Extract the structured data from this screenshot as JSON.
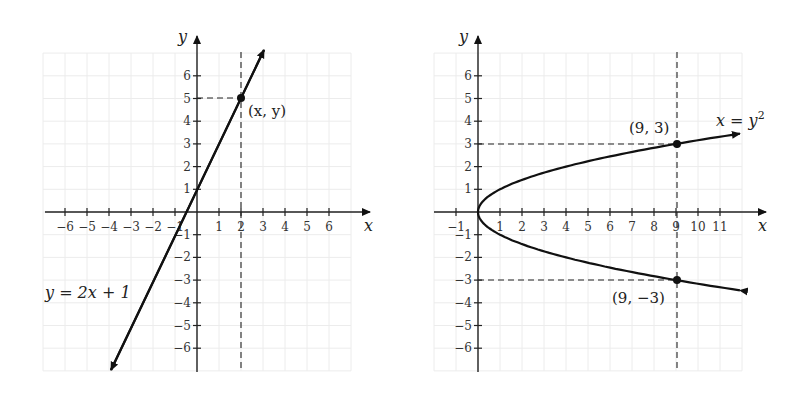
{
  "chart_data": [
    {
      "type": "line",
      "title": "",
      "equation_label": "y = 2x + 1",
      "xlabel": "x",
      "ylabel": "y",
      "xlim": [
        -7,
        7
      ],
      "ylim": [
        -7,
        7
      ],
      "x_ticks": [
        -6,
        -5,
        -4,
        -3,
        -2,
        -1,
        1,
        2,
        3,
        4,
        5,
        6
      ],
      "y_ticks": [
        -6,
        -5,
        -4,
        -3,
        -2,
        -1,
        1,
        2,
        3,
        4,
        5,
        6
      ],
      "grid": true,
      "series": [
        {
          "name": "y = 2x + 1",
          "x": [
            -4,
            3
          ],
          "y": [
            -7,
            7
          ]
        }
      ],
      "points": [
        {
          "x": 2,
          "y": 5,
          "label": "(x, y)"
        }
      ],
      "guides": [
        {
          "type": "vertical-dashed",
          "x": 2
        },
        {
          "type": "horizontal-dashed",
          "y": 5,
          "from_x": 0,
          "to_x": 2
        }
      ]
    },
    {
      "type": "line",
      "title": "",
      "equation_label": "x = y²",
      "xlabel": "x",
      "ylabel": "y",
      "xlim": [
        -1.5,
        13
      ],
      "ylim": [
        -7,
        7
      ],
      "x_ticks": [
        -1,
        1,
        2,
        3,
        4,
        5,
        6,
        7,
        8,
        9,
        10,
        11
      ],
      "y_ticks": [
        -6,
        -5,
        -4,
        -3,
        -2,
        -1,
        1,
        2,
        3,
        4,
        5,
        6
      ],
      "grid": true,
      "series": [
        {
          "name": "x = y²",
          "x": [
            12,
            9,
            4,
            1,
            0,
            1,
            4,
            9,
            12
          ],
          "y": [
            3.46,
            3,
            2,
            1,
            0,
            -1,
            -2,
            -3,
            -3.46
          ]
        }
      ],
      "points": [
        {
          "x": 9,
          "y": 3,
          "label": "(9, 3)"
        },
        {
          "x": 9,
          "y": -3,
          "label": "(9, −3)"
        }
      ],
      "guides": [
        {
          "type": "vertical-dashed",
          "x": 9
        },
        {
          "type": "horizontal-dashed",
          "y": 3,
          "from_x": 0,
          "to_x": 9
        },
        {
          "type": "horizontal-dashed",
          "y": -3,
          "from_x": 0,
          "to_x": 9
        }
      ]
    }
  ],
  "left": {
    "axis_x": "x",
    "axis_y": "y",
    "equation": "y = 2x + 1",
    "point_label": "(x, y)",
    "xticks": [
      "−6",
      "−5",
      "−4",
      "−3",
      "−2",
      "−1",
      "1",
      "2",
      "3",
      "4",
      "5",
      "6"
    ],
    "yticks_pos": [
      "1",
      "2",
      "3",
      "4",
      "5",
      "6"
    ],
    "yticks_neg": [
      "−1",
      "−2",
      "−3",
      "−4",
      "−5",
      "−6"
    ]
  },
  "right": {
    "axis_x": "x",
    "axis_y": "y",
    "equation_base": "x = y",
    "equation_sup": "2",
    "point_top": "(9, 3)",
    "point_bottom": "(9, −3)",
    "xticks": [
      "−1",
      "1",
      "2",
      "3",
      "4",
      "5",
      "6",
      "7",
      "8",
      "9",
      "10",
      "11"
    ],
    "yticks_pos": [
      "1",
      "2",
      "3",
      "4",
      "5",
      "6"
    ],
    "yticks_neg": [
      "−1",
      "−2",
      "−3",
      "−4",
      "−5",
      "−6"
    ]
  }
}
